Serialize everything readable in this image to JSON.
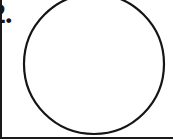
{
  "page": {
    "width": 173,
    "height": 139,
    "background_color": "#ffffff",
    "ink_color": "#151515"
  },
  "label": {
    "text": "2.",
    "clipped_at_left_edge": true
  },
  "figure": {
    "shape_name": "circle-outline",
    "stroke_color": "#151515",
    "stroke_width": 2,
    "fill": "none",
    "clipped_at_top_edge": true,
    "center_x": 94,
    "center_y": 64,
    "radius": 70
  },
  "frame": {
    "border_color": "#1a1a1a",
    "left_rule": true,
    "bottom_rule": true
  }
}
